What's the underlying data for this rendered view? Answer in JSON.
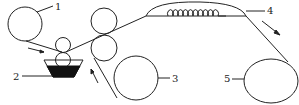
{
  "diagram": {
    "type": "process schematic (coating line)",
    "labels": {
      "l1": "1",
      "l2": "2",
      "l3": "3",
      "l4": "4",
      "l5": "5"
    },
    "components": [
      {
        "id": "1",
        "name": "unwind roll"
      },
      {
        "id": "2",
        "name": "coating trough with applicator rollers"
      },
      {
        "id": "3",
        "name": "secondary unwind roll"
      },
      {
        "id": "4",
        "name": "drying hood with heating coil"
      },
      {
        "id": "5",
        "name": "rewind roll"
      }
    ],
    "colors": {
      "stroke": "#222222",
      "fill_liquid": "#111111",
      "background": "#ffffff"
    }
  }
}
